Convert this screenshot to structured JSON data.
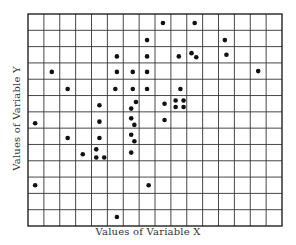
{
  "chart_data": {
    "type": "scatter",
    "title": "",
    "xlabel": "Values of Variable X",
    "ylabel": "Values of Variable Y",
    "xlim": [
      0,
      16
    ],
    "ylim": [
      0,
      13
    ],
    "grid": true,
    "x_ticks_labeled": false,
    "y_ticks_labeled": false,
    "points": [
      {
        "x": 0.45,
        "y": 6.3
      },
      {
        "x": 0.45,
        "y": 2.5
      },
      {
        "x": 1.5,
        "y": 9.45
      },
      {
        "x": 2.5,
        "y": 8.4
      },
      {
        "x": 2.5,
        "y": 5.4
      },
      {
        "x": 3.45,
        "y": 4.4
      },
      {
        "x": 4.3,
        "y": 4.7
      },
      {
        "x": 4.3,
        "y": 4.2
      },
      {
        "x": 4.8,
        "y": 4.2
      },
      {
        "x": 4.5,
        "y": 7.4
      },
      {
        "x": 4.5,
        "y": 6.4
      },
      {
        "x": 4.5,
        "y": 5.4
      },
      {
        "x": 5.6,
        "y": 10.4
      },
      {
        "x": 5.6,
        "y": 9.45
      },
      {
        "x": 5.5,
        "y": 8.4
      },
      {
        "x": 5.6,
        "y": 0.55
      },
      {
        "x": 6.6,
        "y": 9.45
      },
      {
        "x": 6.6,
        "y": 8.4
      },
      {
        "x": 6.8,
        "y": 7.6
      },
      {
        "x": 6.5,
        "y": 7.2
      },
      {
        "x": 6.5,
        "y": 6.6
      },
      {
        "x": 6.7,
        "y": 6.2
      },
      {
        "x": 6.5,
        "y": 5.6
      },
      {
        "x": 6.7,
        "y": 5.2
      },
      {
        "x": 6.5,
        "y": 4.5
      },
      {
        "x": 7.5,
        "y": 11.4
      },
      {
        "x": 7.5,
        "y": 10.4
      },
      {
        "x": 7.5,
        "y": 9.45
      },
      {
        "x": 7.5,
        "y": 8.4
      },
      {
        "x": 7.6,
        "y": 2.5
      },
      {
        "x": 8.5,
        "y": 12.45
      },
      {
        "x": 8.6,
        "y": 7.5
      },
      {
        "x": 8.6,
        "y": 6.5
      },
      {
        "x": 9.5,
        "y": 10.4
      },
      {
        "x": 9.6,
        "y": 8.4
      },
      {
        "x": 9.3,
        "y": 7.7
      },
      {
        "x": 9.8,
        "y": 7.7
      },
      {
        "x": 9.3,
        "y": 7.3
      },
      {
        "x": 9.8,
        "y": 7.3
      },
      {
        "x": 10.3,
        "y": 10.6
      },
      {
        "x": 10.6,
        "y": 10.35
      },
      {
        "x": 10.5,
        "y": 12.45
      },
      {
        "x": 12.4,
        "y": 11.4
      },
      {
        "x": 12.5,
        "y": 10.5
      },
      {
        "x": 14.5,
        "y": 9.5
      }
    ]
  }
}
